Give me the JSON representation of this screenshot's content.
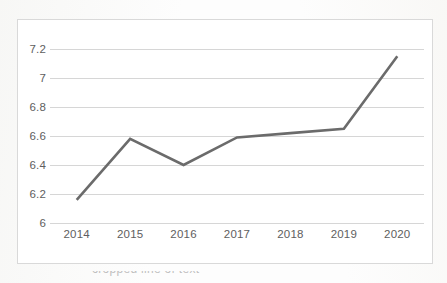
{
  "chart_data": {
    "type": "line",
    "title": "",
    "subtitle": "",
    "xlabel": "",
    "ylabel": "",
    "categories": [
      "2014",
      "2015",
      "2016",
      "2017",
      "2018",
      "2019",
      "2020"
    ],
    "values": [
      6.16,
      6.58,
      6.4,
      6.59,
      6.62,
      6.65,
      7.15
    ],
    "series": [
      {
        "name": "",
        "values": [
          6.16,
          6.58,
          6.4,
          6.59,
          6.62,
          6.65,
          7.15
        ]
      }
    ],
    "ylim": [
      6,
      7.2
    ],
    "ytick_labels": [
      "7.2",
      "7",
      "6.8",
      "6.6",
      "6.4",
      "6.2",
      "6"
    ],
    "ytick_values": [
      7.2,
      7.0,
      6.8,
      6.6,
      6.4,
      6.2,
      6.0
    ],
    "xtick_labels": [
      "2014",
      "2015",
      "2016",
      "2017",
      "2018",
      "2019",
      "2020"
    ],
    "grid": true,
    "grid_axis": "y",
    "legend": false,
    "legend_position": "none",
    "annotations": [],
    "colors": {
      "line": "#6b6b6b",
      "gridline": "#d6d6d6",
      "border": "#d9d9d9",
      "tick_label": "#5e5e5e",
      "plot_background": "#ffffff"
    }
  },
  "caption": {
    "text": "cropped line of text"
  }
}
